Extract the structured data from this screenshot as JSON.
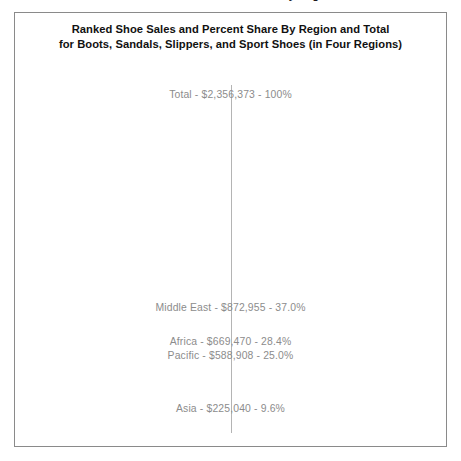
{
  "clipped_header_text": "Ranked Shoe Sales and Percent Share By Region and Total",
  "chart": {
    "title_line_1": "Ranked Shoe Sales and Percent Share By Region and Total",
    "title_line_2": "for Boots, Sandals, Slippers, and Sport Shoes (in Four Regions)",
    "label_color": "#8c8c8c",
    "title_color": "#111111",
    "axis_color": "#b4b4b4",
    "border_color": "#8a8a8a",
    "background_color": "#ffffff"
  },
  "labels": {
    "total": "Total - $2,356,373 - 100%",
    "middle_east": "Middle East - $872,955 - 37.0%",
    "africa": "Africa - $669,470 - 28.4%",
    "pacific": "Pacific - $588,908 - 25.0%",
    "asia": "Asia - $225,040 - 9.6%"
  },
  "chart_data": {
    "type": "bar",
    "title": "Ranked Shoe Sales and Percent Share By Region and Total for Boots, Sandals, Slippers, and Sport Shoes (in Four Regions)",
    "xlabel": "",
    "ylabel": "",
    "grid": false,
    "legend": "none",
    "orientation": "vertical",
    "categories": [
      "Total",
      "Middle East",
      "Africa",
      "Pacific",
      "Asia"
    ],
    "values": [
      2356373,
      872955,
      669470,
      588908,
      225040
    ],
    "percent_share": [
      100.0,
      37.0,
      28.4,
      25.0,
      9.6
    ],
    "value_labels": [
      "Total - $2,356,373 - 100%",
      "Middle East - $872,955 - 37.0%",
      "Africa - $669,470 - 28.4%",
      "Pacific - $588,908 - 25.0%",
      "Asia - $225,040 - 9.6%"
    ],
    "ylim": [
      0,
      2356373
    ],
    "annotations": [
      {
        "text": "Total - $2,356,373 - 100%",
        "value": 2356373
      },
      {
        "text": "Middle East - $872,955 - 37.0%",
        "value": 872955
      },
      {
        "text": "Africa - $669,470 - 28.4%",
        "value": 669470
      },
      {
        "text": "Pacific - $588,908 - 25.0%",
        "value": 588908
      },
      {
        "text": "Asia - $225,040 - 9.6%",
        "value": 225040
      }
    ]
  }
}
